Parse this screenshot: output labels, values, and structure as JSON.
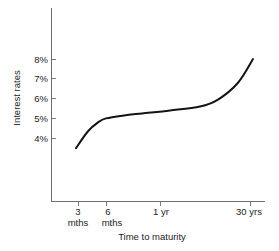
{
  "chart_data": {
    "type": "line",
    "title": "",
    "xlabel": "Time to maturity",
    "ylabel": "Interest rates",
    "grid": false,
    "legend": false,
    "ylim": [
      3,
      9
    ],
    "yticks": [
      "4%",
      "5%",
      "6%",
      "7%",
      "8%"
    ],
    "ytick_values": [
      4,
      5,
      6,
      7,
      8
    ],
    "xticks": [
      {
        "line1": "3",
        "line2": "mths"
      },
      {
        "line1": "6",
        "line2": "mths"
      },
      {
        "line1": "1 yr",
        "line2": ""
      },
      {
        "line1": "30 yrs",
        "line2": ""
      }
    ],
    "xtick_labels": [
      "3 mths",
      "6 mths",
      "1 yr",
      "30 yrs"
    ],
    "series": [
      {
        "name": "Yield curve",
        "color": "#141414",
        "x": [
          "3 mths",
          "4 mths",
          "5 mths",
          "6 mths",
          "9 mths",
          "1 yr",
          "2 yrs",
          "5 yrs",
          "10 yrs",
          "20 yrs",
          "30 yrs"
        ],
        "values": [
          3.5,
          4.35,
          4.8,
          5.0,
          5.15,
          5.25,
          5.4,
          5.6,
          5.95,
          6.8,
          8.0
        ]
      }
    ]
  },
  "axes": {
    "y_axis_name": "interest-rates-axis",
    "x_axis_name": "time-to-maturity-axis"
  },
  "labels": {
    "y_title": "Interest rates",
    "x_title": "Time to maturity",
    "y_tick_8": "8%",
    "y_tick_7": "7%",
    "y_tick_6": "6%",
    "y_tick_5": "5%",
    "y_tick_4": "4%",
    "x_tick_3_top": "3",
    "x_tick_3_bottom": "mths",
    "x_tick_6_top": "6",
    "x_tick_6_bottom": "mths",
    "x_tick_1yr": "1 yr",
    "x_tick_30yrs": "30 yrs"
  },
  "colors": {
    "curve": "#141414",
    "axis": "#6f6f6f",
    "background": "#ffffff",
    "text": "#1c1c1c"
  }
}
